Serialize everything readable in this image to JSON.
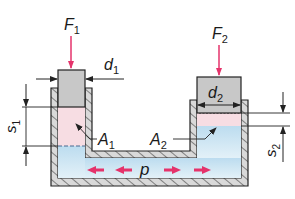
{
  "diagram": {
    "type": "hydraulic-press-schematic",
    "labels": {
      "force_1": "F",
      "force_1_sub": "1",
      "force_2": "F",
      "force_2_sub": "2",
      "diameter_1": "d",
      "diameter_1_sub": "1",
      "diameter_2": "d",
      "diameter_2_sub": "2",
      "area_1": "A",
      "area_1_sub": "1",
      "area_2": "A",
      "area_2_sub": "2",
      "stroke_1": "s",
      "stroke_1_sub": "1",
      "stroke_2": "s",
      "stroke_2_sub": "2",
      "pressure": "p"
    },
    "colors": {
      "force_arrow": "#e5336b",
      "pressure_arrow": "#e5336b",
      "fluid": "#cfe6f3",
      "displaced_zone": "#f7dde3",
      "piston": "#c8c8c8",
      "wall": "#d9d9d9",
      "outline": "#222222"
    }
  }
}
